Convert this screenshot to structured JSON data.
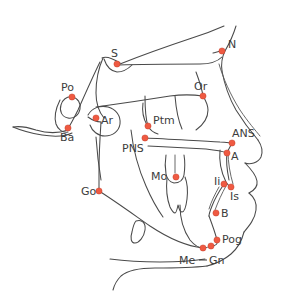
{
  "figure": {
    "background_color": "#ffffff",
    "trace_color": "#4a4a4a",
    "landmark_color": "#ef5a42",
    "landmark_stroke_color": "#c7402c",
    "label_color": "#3d3d3d",
    "width": 284,
    "height": 292
  },
  "landmarks": [
    {
      "id": "S",
      "label": "S",
      "name": "sella",
      "dot_x": 117,
      "dot_y": 64,
      "label_x": 111,
      "label_y": 57
    },
    {
      "id": "N",
      "label": "N",
      "name": "nasion",
      "dot_x": 222,
      "dot_y": 51,
      "label_x": 228,
      "label_y": 48
    },
    {
      "id": "Po",
      "label": "Po",
      "name": "porion",
      "dot_x": 72,
      "dot_y": 97,
      "label_x": 61,
      "label_y": 91
    },
    {
      "id": "Or",
      "label": "Or",
      "name": "orbitale",
      "dot_x": 203,
      "dot_y": 96,
      "label_x": 194,
      "label_y": 90
    },
    {
      "id": "Ar",
      "label": "Ar",
      "name": "articulare",
      "dot_x": 96,
      "dot_y": 118,
      "label_x": 101,
      "label_y": 124
    },
    {
      "id": "Ba",
      "label": "Ba",
      "name": "basion",
      "dot_x": 68,
      "dot_y": 128,
      "label_x": 60,
      "label_y": 141
    },
    {
      "id": "Ptm",
      "label": "Ptm",
      "name": "pterygomaxillary-fissure",
      "dot_x": 148,
      "dot_y": 126,
      "label_x": 153,
      "label_y": 124
    },
    {
      "id": "PNS",
      "label": "PNS",
      "name": "posterior-nasal-spine",
      "dot_x": 145,
      "dot_y": 138,
      "label_x": 122,
      "label_y": 152
    },
    {
      "id": "ANS",
      "label": "ANS",
      "name": "anterior-nasal-spine",
      "dot_x": 232,
      "dot_y": 143,
      "label_x": 232,
      "label_y": 137
    },
    {
      "id": "A",
      "label": "A",
      "name": "a-point-subspinale",
      "dot_x": 227,
      "dot_y": 153,
      "label_x": 231,
      "label_y": 160
    },
    {
      "id": "Mo",
      "label": "Mo",
      "name": "molar",
      "dot_x": 176,
      "dot_y": 177,
      "label_x": 151,
      "label_y": 180
    },
    {
      "id": "Ii",
      "label": "Ii",
      "name": "incisor-inferior",
      "dot_x": 224,
      "dot_y": 184,
      "label_x": 214,
      "label_y": 185
    },
    {
      "id": "Is",
      "label": "Is",
      "name": "incisor-superior",
      "dot_x": 231,
      "dot_y": 187,
      "label_x": 230,
      "label_y": 200
    },
    {
      "id": "Go",
      "label": "Go",
      "name": "gonion",
      "dot_x": 99,
      "dot_y": 191,
      "label_x": 81,
      "label_y": 195
    },
    {
      "id": "B",
      "label": "B",
      "name": "b-point-supramentale",
      "dot_x": 216,
      "dot_y": 213,
      "label_x": 221,
      "label_y": 217
    },
    {
      "id": "Pog",
      "label": "Pog",
      "name": "pogonion",
      "dot_x": 217,
      "dot_y": 240,
      "label_x": 222,
      "label_y": 243
    },
    {
      "id": "Gn",
      "label": "Gn",
      "name": "gnathion",
      "dot_x": 211,
      "dot_y": 246,
      "label_x": 209,
      "label_y": 264
    },
    {
      "id": "Me",
      "label": "Me",
      "name": "menton",
      "dot_x": 203,
      "dot_y": 248,
      "label_x": 179,
      "label_y": 264
    }
  ],
  "chart_data": {
    "type": "scatter",
    "xlabel": "",
    "ylabel": "",
    "xlim": [
      0,
      284
    ],
    "ylim": [
      292,
      0
    ],
    "grid": false,
    "legend": "none",
    "categories": [
      "S",
      "N",
      "Po",
      "Or",
      "Ar",
      "Ba",
      "Ptm",
      "PNS",
      "ANS",
      "A",
      "Mo",
      "Ii",
      "Is",
      "Go",
      "B",
      "Pog",
      "Gn",
      "Me"
    ],
    "x": [
      117,
      222,
      72,
      203,
      96,
      68,
      148,
      145,
      232,
      227,
      176,
      224,
      231,
      99,
      216,
      217,
      211,
      203
    ],
    "y": [
      64,
      51,
      97,
      96,
      118,
      128,
      126,
      138,
      143,
      153,
      177,
      184,
      187,
      191,
      213,
      240,
      246,
      248
    ],
    "annotations": [
      "S = sella",
      "N = nasion",
      "Po = porion",
      "Or = orbitale",
      "Ar = articulare",
      "Ba = basion",
      "Ptm = pterygomaxillary fissure",
      "PNS = posterior nasal spine",
      "ANS = anterior nasal spine",
      "A = A point",
      "Mo = molar",
      "Ii = incisor inferior",
      "Is = incisor superior",
      "Go = gonion",
      "B = B point",
      "Pog = pogonion",
      "Gn = gnathion",
      "Me = menton"
    ]
  }
}
